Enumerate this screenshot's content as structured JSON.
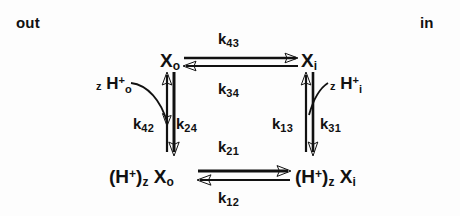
{
  "diagram": {
    "type": "reaction-cycle",
    "stroke_color": "#111111",
    "background_color": "#fdfdfd",
    "sides": {
      "left_label": "out",
      "right_label": "in"
    },
    "nodes": [
      {
        "id": "Xo",
        "label_main": "X",
        "label_sub": "o",
        "position": "top-left"
      },
      {
        "id": "Xi",
        "label_main": "X",
        "label_sub": "i",
        "position": "top-right"
      },
      {
        "id": "HXo",
        "label_main": "(H",
        "label_sup": "+",
        "label_close": ")",
        "label_sub": "z",
        "label_carrier": "X",
        "label_carrier_sub": "o",
        "position": "bottom-left"
      },
      {
        "id": "HXi",
        "label_main": "(H",
        "label_sup": "+",
        "label_close": ")",
        "label_sub": "z",
        "label_carrier": "X",
        "label_carrier_sub": "i",
        "position": "bottom-right"
      }
    ],
    "protons": [
      {
        "id": "proton-out",
        "stoich": "z",
        "main": "H",
        "sup": "+",
        "sub": "o"
      },
      {
        "id": "proton-in",
        "stoich": "z",
        "main": "H",
        "sup": "+",
        "sub": "i"
      }
    ],
    "rates": [
      {
        "id": "k43",
        "main": "k",
        "sub": "43",
        "edge": "top",
        "direction": "left-to-right"
      },
      {
        "id": "k34",
        "main": "k",
        "sub": "34",
        "edge": "top",
        "direction": "right-to-left"
      },
      {
        "id": "k21",
        "main": "k",
        "sub": "21",
        "edge": "bottom",
        "direction": "left-to-right"
      },
      {
        "id": "k12",
        "main": "k",
        "sub": "12",
        "edge": "bottom",
        "direction": "right-to-left"
      },
      {
        "id": "k42",
        "main": "k",
        "sub": "42",
        "edge": "left",
        "direction": "downward-binding"
      },
      {
        "id": "k24",
        "main": "k",
        "sub": "24",
        "edge": "left",
        "direction": "downward"
      },
      {
        "id": "k13",
        "main": "k",
        "sub": "13",
        "edge": "right",
        "direction": "upward"
      },
      {
        "id": "k31",
        "main": "k",
        "sub": "31",
        "edge": "right",
        "direction": "downward"
      }
    ]
  }
}
